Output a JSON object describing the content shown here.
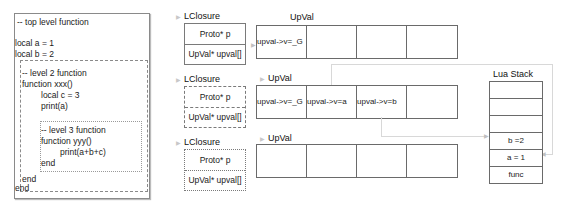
{
  "code": {
    "top_comment": "-- top level function",
    "top_lines": [
      "local a = 1",
      "local b = 2"
    ],
    "level2": {
      "comment": "-- level 2 function",
      "header": "function xxx()",
      "body": [
        "local c = 3",
        "print(a)"
      ],
      "end": "end"
    },
    "level3": {
      "comment": "-- level 3 function",
      "header": "function yyy()",
      "body": [
        "print(a+b+c)"
      ],
      "end": "end"
    },
    "end": "end"
  },
  "closures": [
    {
      "label": "LClosure",
      "border": "solid",
      "fields": [
        "Proto* p",
        "UpVal* upval[]"
      ],
      "upval_label": "UpVal",
      "upvals": [
        "upval->v=_G",
        "",
        "",
        ""
      ]
    },
    {
      "label": "LClosure",
      "border": "dashed",
      "fields": [
        "Proto* p",
        "UpVal* upval[]"
      ],
      "upval_label": "UpVal",
      "upvals": [
        "upval->v=_G",
        "upval->v=a",
        "upval->v=b",
        ""
      ]
    },
    {
      "label": "LClosure",
      "border": "dotted",
      "fields": [
        "Proto* p",
        "UpVal* upval[]"
      ],
      "upval_label": "UpVal",
      "upvals": [
        "",
        "",
        "",
        ""
      ]
    }
  ],
  "lua_stack": {
    "title": "Lua Stack",
    "cells": [
      "",
      "",
      "",
      "b =2",
      "a = 1",
      "func"
    ]
  },
  "colors": {
    "border": "#6a6a6a",
    "connector": "#d8d8d8",
    "text": "#1a1a1a"
  }
}
